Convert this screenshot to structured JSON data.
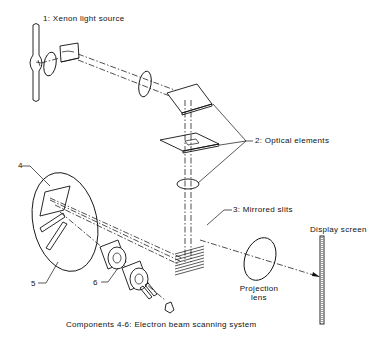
{
  "diagram": {
    "title": "Components 4-6:  Electron beam scanning system",
    "labels": {
      "xenon": "1:  Xenon light source",
      "optical": "2:  Optical elements",
      "slits": "3:  Mirrored slits",
      "display": "Display screen",
      "projection_line1": "Projection",
      "projection_line2": "lens",
      "num4": "4",
      "num5": "5",
      "num6": "6"
    },
    "components": [
      {
        "id": 1,
        "name": "Xenon light source"
      },
      {
        "id": 2,
        "name": "Optical elements"
      },
      {
        "id": 3,
        "name": "Mirrored slits"
      },
      {
        "id": 4,
        "name": "Component 4"
      },
      {
        "id": 5,
        "name": "Component 5"
      },
      {
        "id": 6,
        "name": "Component 6"
      },
      {
        "id": "screen",
        "name": "Display screen"
      },
      {
        "id": "lens",
        "name": "Projection lens"
      }
    ],
    "colors": {
      "line": "#111111",
      "background": "#ffffff"
    }
  }
}
